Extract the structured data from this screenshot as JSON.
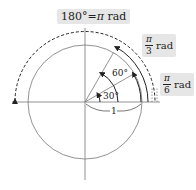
{
  "diagram": {
    "title_label": {
      "left": "180°",
      "eq": "=",
      "pi": "π",
      "unit": " rad"
    },
    "label_pi_3": {
      "num": "π",
      "den": "3",
      "unit": "rad"
    },
    "label_pi_6": {
      "num": "π",
      "den": "6",
      "unit": "rad"
    },
    "angle_60": "60°",
    "angle_30": "30°",
    "radius_label": "1",
    "colors": {
      "line": "#555555",
      "arrow": "#222222",
      "label_bg": "#e6e6e6"
    }
  }
}
